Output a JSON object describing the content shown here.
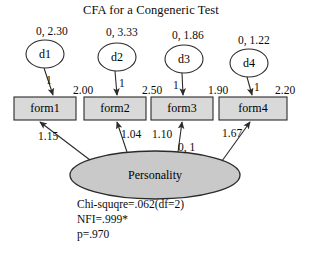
{
  "diagram": {
    "title": "CFA for a Congeneric Test",
    "type": "confirmatory-factor-analysis-path-diagram",
    "colors": {
      "box_fill": "#d9d9d9",
      "ellipse_fill": "#c9c9c9",
      "circle_fill": "#ffffff",
      "stroke": "#2b2b2b",
      "text": "#0b0b0b",
      "background": "#ffffff"
    },
    "errors": [
      {
        "name": "d1",
        "params": "0, 2.30",
        "fixed_loading": "1"
      },
      {
        "name": "d2",
        "params": "0, 3.33",
        "fixed_loading": "1"
      },
      {
        "name": "d3",
        "params": "0, 1.86",
        "fixed_loading": "1"
      },
      {
        "name": "d4",
        "params": "0, 1.22",
        "fixed_loading": "1"
      }
    ],
    "indicators": [
      {
        "name": "form1",
        "intercept": "2.00",
        "loading": "1.15"
      },
      {
        "name": "form2",
        "intercept": "2.50",
        "loading": "1.04"
      },
      {
        "name": "form3",
        "intercept": "1.90",
        "loading": "1.10"
      },
      {
        "name": "form4",
        "intercept": "2.20",
        "loading": "1.67"
      }
    ],
    "factor": {
      "name": "Personality",
      "params": "0, 1"
    },
    "fit": {
      "line1": "Chi-squqre=.062(df=2)",
      "line2": "NFI=.999*",
      "line3": "p=.970"
    }
  }
}
